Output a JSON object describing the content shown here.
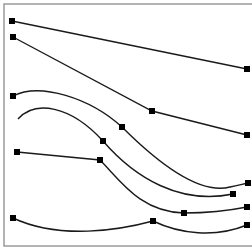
{
  "canvas": {
    "width": 252,
    "height": 252,
    "background": "#ffffff"
  },
  "frame": {
    "color": "#9a9a9a",
    "left": 4,
    "top": 4,
    "right": 252,
    "bottom": 246
  },
  "style": {
    "line_color": "#1a1a1a",
    "marker_color": "#000000",
    "marker_size": 6
  },
  "curves": [
    {
      "name": "curve-1",
      "path": "M12,21 L247,69",
      "markers": [
        [
          12,
          21
        ],
        [
          247,
          69
        ]
      ]
    },
    {
      "name": "curve-2",
      "path": "M13,37 L152,111 L247,135",
      "markers": [
        [
          13,
          37
        ],
        [
          152,
          111
        ],
        [
          247,
          135
        ]
      ]
    },
    {
      "name": "curve-3",
      "path": "M13,96 C40,82 90,98 122,127 C160,165 200,195 230,187 C238,185 244,184 248,183",
      "markers": [
        [
          13,
          96
        ],
        [
          122,
          127
        ],
        [
          248,
          183
        ]
      ]
    },
    {
      "name": "curve-4",
      "path": "M18,119 C35,100 70,105 103,141 C135,178 180,205 233,194",
      "markers": [
        [
          103,
          141
        ],
        [
          233,
          194
        ]
      ]
    },
    {
      "name": "curve-5",
      "path": "M17,152 L100,160 C120,180 140,212 184,213 C210,213 232,210 247,207",
      "markers": [
        [
          17,
          152
        ],
        [
          100,
          160
        ],
        [
          184,
          213
        ],
        [
          247,
          207
        ]
      ]
    },
    {
      "name": "curve-6",
      "path": "M13,218 C60,240 120,230 153,221 C180,234 215,238 247,225",
      "markers": [
        [
          13,
          218
        ],
        [
          153,
          221
        ],
        [
          247,
          225
        ]
      ]
    }
  ]
}
